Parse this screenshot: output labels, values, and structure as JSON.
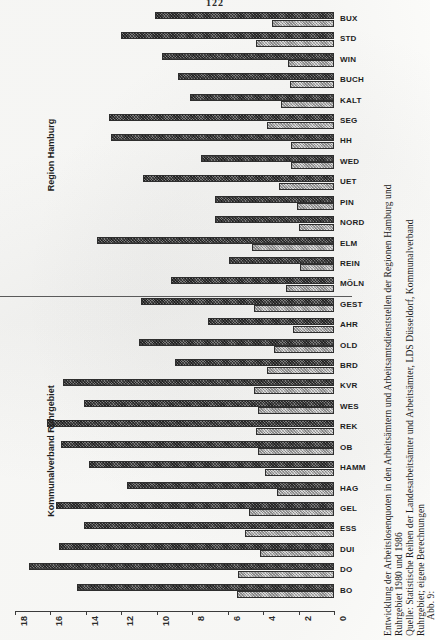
{
  "page": {
    "number": "122"
  },
  "chart_data": {
    "type": "bar",
    "orientation": "horizontal",
    "title": "Entwicklung der Arbeitslosenquoten in den Arbeitsämtern und Arbeitsamtsdienststellen der Regionen Hamburg und Ruhrgebiet 1980 und 1986",
    "xlabel": "",
    "ylabel": "",
    "xlim": [
      18,
      0
    ],
    "x_axis_reversed": true,
    "xticks": [
      18,
      16,
      14,
      12,
      10,
      8,
      6,
      4,
      2,
      0
    ],
    "grid": false,
    "legend_position": "none",
    "categories": [
      "BUX",
      "STD",
      "WIN",
      "BUCH",
      "KALT",
      "SEG",
      "HH",
      "WED",
      "UET",
      "PIN",
      "NORD",
      "ELM",
      "REIN",
      "MÖLN",
      "GEST",
      "AHR",
      "OLD",
      "BRD",
      "KVR",
      "WES",
      "REK",
      "OB",
      "HAMM",
      "HAG",
      "GEL",
      "ESS",
      "DUI",
      "DO",
      "BO"
    ],
    "series": [
      {
        "name": "1986",
        "values": [
          10.1,
          12.0,
          9.7,
          8.8,
          8.1,
          12.7,
          12.6,
          7.5,
          10.8,
          6.7,
          6.7,
          13.4,
          5.9,
          9.2,
          10.9,
          7.1,
          11.0,
          9.0,
          15.3,
          14.1,
          16.2,
          15.4,
          13.8,
          11.7,
          15.7,
          14.1,
          15.5,
          17.2,
          14.5
        ]
      },
      {
        "name": "1980",
        "values": [
          3.5,
          4.4,
          2.6,
          2.5,
          3.0,
          3.8,
          2.4,
          2.4,
          3.1,
          2.1,
          2.0,
          4.6,
          1.9,
          2.7,
          4.5,
          2.3,
          3.4,
          3.8,
          4.5,
          4.3,
          4.4,
          4.3,
          3.9,
          3.2,
          4.8,
          5.0,
          4.2,
          5.4,
          5.5
        ]
      }
    ],
    "groups": [
      {
        "label": "Region Hamburg",
        "categories": [
          "BUX",
          "STD",
          "WIN",
          "BUCH",
          "KALT",
          "SEG",
          "HH",
          "WED",
          "UET",
          "PIN",
          "NORD",
          "ELM",
          "REIN",
          "MÖLN"
        ]
      },
      {
        "label": "Kommunalverband Ruhrgebiet",
        "categories": [
          "GEST",
          "AHR",
          "OLD",
          "BRD",
          "KVR",
          "WES",
          "REK",
          "OB",
          "HAMM",
          "HAG",
          "GEL",
          "ESS",
          "DUI",
          "DO",
          "BO"
        ]
      }
    ]
  },
  "caption": {
    "figure_number": "Abb. 9:",
    "line1": "Entwicklung der Arbeitslosenquoten in den Arbeitsämtern und Arbeitsamtsdienststellen der Regionen Hamburg und",
    "line2": "Ruhrgebiet 1980 und 1986",
    "line3": "Quelle: Statistische Reihen der Landesarbeitsämter und Arbeitsämter, LDS Düsseldorf, Kommunalverband",
    "line4": "Ruhrgebiet; eigene Berechnungen"
  }
}
